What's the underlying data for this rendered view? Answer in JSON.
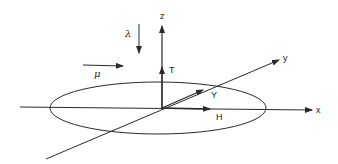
{
  "diagram": {
    "colors": {
      "stroke": "#2a2a2a",
      "background": "#ffffff"
    },
    "axes": {
      "x": {
        "label": "x"
      },
      "y": {
        "label": "y"
      },
      "z": {
        "label": "z"
      }
    },
    "vectors": {
      "T": {
        "label": "T",
        "direction": "+z"
      },
      "Y": {
        "label": "Y",
        "direction": "+y"
      },
      "H": {
        "label": "H",
        "direction": "+x"
      },
      "lambda": {
        "label": "λ",
        "direction": "-z"
      },
      "mu": {
        "label": "μ",
        "direction": "+x"
      }
    },
    "shapes": {
      "ellipse": {
        "plane": "x-y",
        "centered_at": "origin"
      }
    }
  }
}
